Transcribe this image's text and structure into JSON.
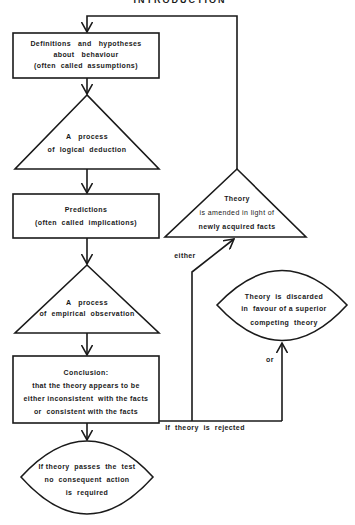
{
  "header": {
    "cut_title": "INTRODUCTION"
  },
  "nodes": {
    "assumptions": {
      "shape": "rectangle",
      "lines": [
        "Definitions   and   hypotheses",
        "about   behaviour",
        "(often  called  assumptions)"
      ]
    },
    "deduction": {
      "shape": "triangle",
      "lines": [
        "A   process",
        "of  logical  deduction"
      ]
    },
    "predictions": {
      "shape": "rectangle",
      "lines": [
        "Predictions",
        "(often  called  implications)"
      ]
    },
    "observation": {
      "shape": "triangle",
      "lines": [
        "A   process",
        "of  empirical  observation"
      ]
    },
    "conclusion": {
      "shape": "rectangle",
      "lines": [
        "Conclusion:",
        "that the theory appears to be",
        "either inconsistent  with the facts",
        "or  consistent with the facts"
      ]
    },
    "passes": {
      "shape": "lens",
      "lines": [
        "If theory  passes  the  test",
        "no  consequent  action",
        "is  required"
      ]
    },
    "amended": {
      "shape": "triangle",
      "lines": [
        "Theory",
        "is amended in light of",
        "newly acquired facts"
      ]
    },
    "discarded": {
      "shape": "lens",
      "lines": [
        "Theory  is  discarded",
        "in  favour of a superior",
        "competing  theory"
      ]
    }
  },
  "edge_labels": {
    "rejected": "If  theory  is  rejected",
    "either": "either",
    "or": "or"
  }
}
